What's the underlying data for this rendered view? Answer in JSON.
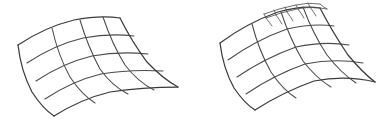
{
  "figure": {
    "background_color": "#ffffff",
    "line_color": "#4a4a4a",
    "boundary_color": "#3b3b3b",
    "refined_line_color": "#555555",
    "canvas": {
      "width": 387,
      "height": 127
    }
  },
  "panels": [
    {
      "id": "left-mesh",
      "label": "Uniform curved quad mesh",
      "grid": {
        "rows": 4,
        "cols": 4
      },
      "refinement": null,
      "corners": {
        "left": [
          18,
          45
        ],
        "top": [
          120,
          18
        ],
        "right": [
          178,
          87
        ],
        "bottom": [
          54,
          116
        ]
      }
    },
    {
      "id": "right-mesh",
      "label": "Locally refined curved quad mesh",
      "grid": {
        "rows": 4,
        "cols": 4
      },
      "refinement": {
        "sub_rows": 2,
        "sub_cols": 3,
        "location": "top-edge",
        "description": "3 by 2 block of refined cells on the upper boundary"
      },
      "corners": {
        "left": [
          220,
          43
        ],
        "top": [
          320,
          8
        ],
        "right": [
          375,
          82
        ],
        "bottom": [
          255,
          110
        ]
      }
    }
  ],
  "chart_data": {
    "type": "diagram",
    "xlabel": "",
    "ylabel": "",
    "series": [
      {
        "name": "left-mesh",
        "grid_rows": 4,
        "grid_cols": 4,
        "cells": 16,
        "refined_cells": 0
      },
      {
        "name": "right-mesh",
        "grid_rows": 4,
        "grid_cols": 4,
        "cells": 16,
        "refined_cells": 6
      }
    ]
  }
}
